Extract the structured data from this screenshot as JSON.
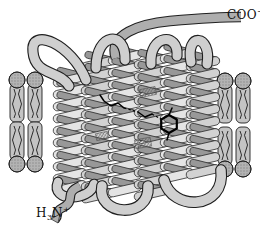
{
  "figure": {
    "caption": "Seven-transmembrane-helix protein embedded in a lipid bilayer with bound retinal chromophore",
    "background": "#ffffff"
  },
  "labels": {
    "c_terminus": {
      "main": "COO",
      "sup": "−"
    },
    "n_terminus": {
      "h": "H",
      "sub": "3",
      "n": "N",
      "sup": "+"
    }
  },
  "components": {
    "membrane_left": "lipid-bilayer-left-of-protein",
    "membrane_right": "lipid-bilayer-right-of-protein",
    "helices": "seven-transmembrane-alpha-helix-bundle",
    "loops": "connecting-ribbon-loops",
    "ligand": "retinal-chromophore-with-ionone-ring"
  },
  "colors": {
    "ribbon_front_light": "#e4e4e4",
    "ribbon_front_mid": "#d2d2d2",
    "ribbon_back": "#989898",
    "loop_fill": "#cfcfcf",
    "loop_dark": "#aeaeae",
    "lipid_body": "#c4c4c4",
    "lipid_head": "#b3b3b3",
    "outline": "#1f1f1f",
    "ligand": "#000000",
    "background": "#ffffff"
  }
}
